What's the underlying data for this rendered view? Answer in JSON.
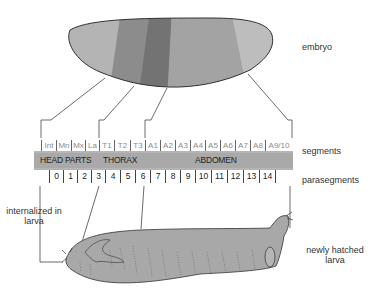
{
  "labels": {
    "embryo": "embryo",
    "segments": "segments",
    "parasegments": "parasegments",
    "internalized": "internalized in larva",
    "larva": "newly hatched larva"
  },
  "segments": [
    "Int",
    "Mn",
    "Mx",
    "La",
    "T1",
    "T2",
    "T3",
    "A1",
    "A2",
    "A3",
    "A4",
    "A5",
    "A6",
    "A7",
    "A8",
    "A9/10"
  ],
  "regions": {
    "head": "HEAD PARTS",
    "thorax": "THORAX",
    "abdomen": "ABDOMEN"
  },
  "parasegments": [
    "0",
    "1",
    "2",
    "3",
    "4",
    "5",
    "6",
    "7",
    "8",
    "9",
    "10",
    "11",
    "12",
    "13",
    "14"
  ],
  "colors": {
    "embryo_head": "#b4b4b4",
    "embryo_band1": "#8c8c8c",
    "embryo_band2": "#737373",
    "embryo_abdomen": "#a3a3a3",
    "embryo_tail": "#bdbdbd",
    "bar": "#a9a9a9",
    "larva": "#a8a8a8"
  }
}
